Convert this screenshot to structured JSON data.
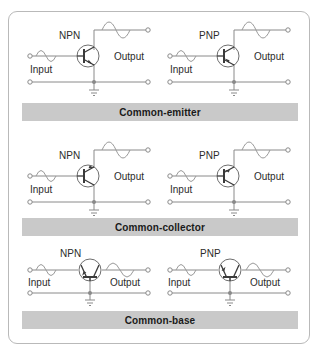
{
  "figure": {
    "background": "#ffffff",
    "frame_color": "#b9b9b9",
    "bar_color": "#c9c9c9",
    "wire_color": "#8a8a8a",
    "symbol_color": "#3a3a3a"
  },
  "common_labels": {
    "input": "Input",
    "output": "Output",
    "npn": "NPN",
    "pnp": "PNP"
  },
  "sections": [
    {
      "id": "common-emitter",
      "bar_label": "Common-emitter",
      "circuits": [
        {
          "id": "ce-npn",
          "device": "NPN",
          "device_label": "NPN",
          "input_label": "Input",
          "output_label": "Output",
          "orientation": "vertical",
          "input_port": "base",
          "output_port": "collector",
          "common_port": "emitter",
          "input_wave_cycles": 1,
          "output_wave_cycles": 1,
          "output_amplitude": "large",
          "input_amplitude": "small"
        },
        {
          "id": "ce-pnp",
          "device": "PNP",
          "device_label": "PNP",
          "input_label": "Input",
          "output_label": "Output",
          "orientation": "vertical",
          "input_port": "base",
          "output_port": "collector",
          "common_port": "emitter",
          "input_wave_cycles": 1,
          "output_wave_cycles": 1,
          "output_amplitude": "large",
          "input_amplitude": "small"
        }
      ]
    },
    {
      "id": "common-collector",
      "bar_label": "Common-collector",
      "circuits": [
        {
          "id": "cc-npn",
          "device": "NPN",
          "device_label": "NPN",
          "input_label": "Input",
          "output_label": "Output",
          "orientation": "vertical",
          "input_port": "base",
          "output_port": "emitter",
          "common_port": "collector",
          "input_wave_cycles": 1,
          "output_wave_cycles": 1,
          "output_amplitude": "large",
          "input_amplitude": "small"
        },
        {
          "id": "cc-pnp",
          "device": "PNP",
          "device_label": "PNP",
          "input_label": "Input",
          "output_label": "Output",
          "orientation": "vertical",
          "input_port": "base",
          "output_port": "emitter",
          "common_port": "collector",
          "input_wave_cycles": 1,
          "output_wave_cycles": 1,
          "output_amplitude": "large",
          "input_amplitude": "small"
        }
      ]
    },
    {
      "id": "common-base",
      "bar_label": "Common-base",
      "circuits": [
        {
          "id": "cb-npn",
          "device": "NPN",
          "device_label": "NPN",
          "input_label": "Input",
          "output_label": "Output",
          "orientation": "horizontal",
          "input_port": "emitter",
          "output_port": "collector",
          "common_port": "base",
          "input_wave_cycles": 1,
          "output_wave_cycles": 1,
          "output_amplitude": "large",
          "input_amplitude": "small"
        },
        {
          "id": "cb-pnp",
          "device": "PNP",
          "device_label": "PNP",
          "input_label": "Input",
          "output_label": "Output",
          "orientation": "horizontal",
          "input_port": "emitter",
          "output_port": "collector",
          "common_port": "base",
          "input_wave_cycles": 1,
          "output_wave_cycles": 1,
          "output_amplitude": "large",
          "input_amplitude": "small"
        }
      ]
    }
  ]
}
